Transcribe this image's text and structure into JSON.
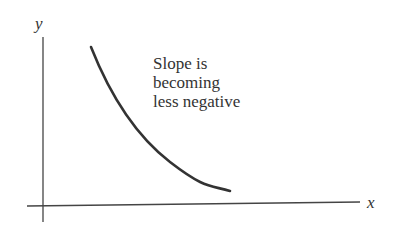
{
  "diagram": {
    "axes": {
      "x_label": "x",
      "y_label": "y"
    },
    "annotation": {
      "lines": [
        "Slope is",
        "becoming",
        "less negative"
      ]
    },
    "curve": {
      "description": "decreasing convex curve",
      "color": "#333333"
    },
    "colors": {
      "axis": "#444444",
      "text": "#333333",
      "background": "#ffffff"
    }
  }
}
